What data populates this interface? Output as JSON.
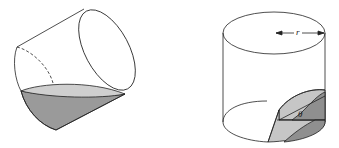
{
  "figures": [
    {
      "id": "tilted-cylinder",
      "description": "Tilted cylindrical glass with liquid forming a wedge at the bottom"
    },
    {
      "id": "upright-cylinder-wedge",
      "description": "Upright cylinder with wedge cut at bottom"
    }
  ],
  "labels": {
    "radius": "r",
    "angle": "θ"
  },
  "colors": {
    "stroke": "#222222",
    "liquid_top": "#c8c8c8",
    "liquid_side": "#9a9a9a",
    "wedge_light": "#c4c4c4",
    "wedge_dark": "#8f8f8f"
  }
}
